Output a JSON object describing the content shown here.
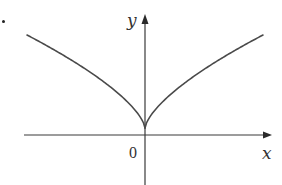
{
  "chart_data": {
    "type": "line",
    "title": "",
    "xlabel": "x",
    "ylabel": "y",
    "origin_label": "0",
    "grid": false,
    "legend": null,
    "series": [
      {
        "name": "curve",
        "shape": "y = |x|^(2/3)",
        "symmetric_about": "y-axis",
        "cusp_at": [
          0,
          0
        ],
        "x": [
          -4,
          -3,
          -2,
          -1,
          -0.5,
          0,
          0.5,
          1,
          2,
          3,
          4
        ],
        "y": [
          2.52,
          2.08,
          1.59,
          1.0,
          0.63,
          0,
          0.63,
          1.0,
          1.59,
          2.08,
          2.52
        ]
      }
    ],
    "axes": {
      "x_axis": {
        "arrow": "right",
        "label": "x"
      },
      "y_axis": {
        "arrow": "up",
        "label": "y"
      }
    },
    "marker": {
      "type": "dot",
      "position": "top-left corner"
    }
  },
  "labels": {
    "y_axis": "y",
    "x_axis": "x",
    "origin": "0"
  },
  "colors": {
    "axis": "#3a3a3a",
    "curve": "#4a4a4a",
    "background": "#ffffff"
  }
}
